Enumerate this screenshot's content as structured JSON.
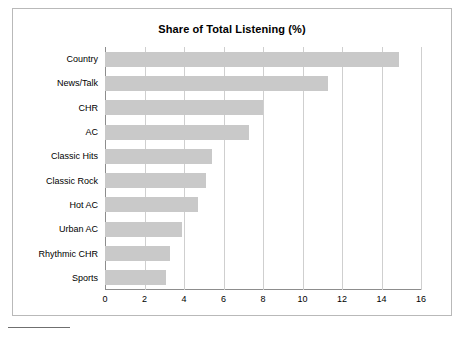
{
  "chart_data": {
    "type": "bar",
    "orientation": "horizontal",
    "title": "Share of Total Listening (%)",
    "xlabel": "",
    "ylabel": "",
    "categories": [
      "Country",
      "News/Talk",
      "CHR",
      "AC",
      "Classic Hits",
      "Classic Rock",
      "Hot AC",
      "Urban AC",
      "Rhythmic CHR",
      "Sports"
    ],
    "values": [
      14.9,
      11.3,
      8.0,
      7.3,
      5.4,
      5.1,
      4.7,
      3.9,
      3.3,
      3.1
    ],
    "xlim": [
      0,
      16
    ],
    "xticks": [
      0,
      2,
      4,
      6,
      8,
      10,
      12,
      14,
      16
    ],
    "xticklabels": [
      "0",
      "2",
      "4",
      "6",
      "8",
      "10",
      "12",
      "14",
      "16"
    ],
    "grid": "vertical",
    "legend": null,
    "bar_color": "#c9c9c9",
    "grid_color": "#cfcfcf",
    "axis_color": "#8d8d8d",
    "frame_color": "#b9b9b9"
  }
}
